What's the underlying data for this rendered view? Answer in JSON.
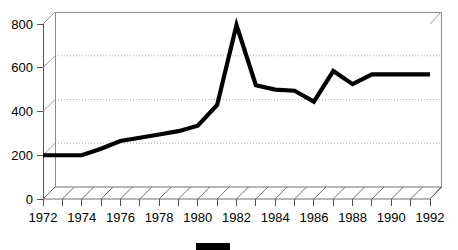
{
  "chart_data": {
    "type": "line",
    "title": "",
    "subtitle": "",
    "xlabel": "",
    "ylabel": "",
    "style": "3d-line-with-hatched-floor",
    "grid": true,
    "grid_axis": "y",
    "gridline_values": [
      200,
      400,
      600
    ],
    "legend_position": "bottom-center",
    "legend_entries": [
      {
        "label": "",
        "color": "#000000",
        "swatch": "filled-rectangle"
      }
    ],
    "ylim": [
      0,
      800
    ],
    "ytick_values": [
      0,
      200,
      400,
      600,
      800
    ],
    "ytick_labels": [
      "0",
      "200",
      "400",
      "600",
      "800"
    ],
    "xlim": [
      1972,
      1992
    ],
    "xtick_values": [
      1972,
      1974,
      1976,
      1978,
      1980,
      1982,
      1984,
      1986,
      1988,
      1990,
      1992
    ],
    "xtick_labels": [
      "1972",
      "1974",
      "1976",
      "1978",
      "1980",
      "1982",
      "1984",
      "1986",
      "1988",
      "1990",
      "1992"
    ],
    "x": [
      1972,
      1973,
      1974,
      1975,
      1976,
      1977,
      1978,
      1979,
      1980,
      1981,
      1982,
      1983,
      1984,
      1985,
      1986,
      1987,
      1988,
      1989,
      1990,
      1991,
      1992
    ],
    "series": [
      {
        "name": "",
        "color": "#000000",
        "values": [
          200,
          200,
          200,
          230,
          265,
          280,
          295,
          310,
          335,
          430,
          795,
          520,
          500,
          495,
          445,
          585,
          525,
          570,
          570,
          570,
          570
        ]
      }
    ],
    "colors": {
      "series": "#000000",
      "axis": "#555555",
      "grid": "#b5b5b5",
      "wall": "#8a8a8a",
      "floor": "#6f6f6f",
      "background": "#ffffff",
      "text": "#000000"
    }
  }
}
